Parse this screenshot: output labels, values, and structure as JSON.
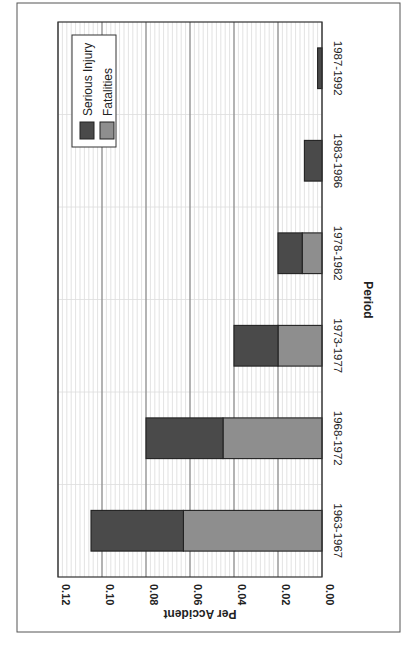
{
  "chart_data": {
    "type": "bar",
    "stacked": true,
    "orientation": "rotated 90 degrees clockwise (vertical bars drawn as horizontal on page)",
    "title": "",
    "xlabel": "Period",
    "ylabel": "Per Accident",
    "ylim": [
      0,
      0.12
    ],
    "yticks": [
      "0.00",
      "0.02",
      "0.04",
      "0.06",
      "0.08",
      "0.10",
      "0.12"
    ],
    "categories": [
      "1963-1967",
      "1968-1972",
      "1973-1977",
      "1978-1982",
      "1983-1986",
      "1987-1992"
    ],
    "series": [
      {
        "name": "Fatalities",
        "color": "#8e8e8e",
        "values": [
          0.063,
          0.045,
          0.02,
          0.009,
          0.0,
          0.0
        ]
      },
      {
        "name": "Serious Injury",
        "color": "#4a4a4a",
        "values": [
          0.042,
          0.035,
          0.02,
          0.011,
          0.008,
          0.002
        ]
      }
    ],
    "totals": [
      0.105,
      0.08,
      0.04,
      0.02,
      0.008,
      0.002
    ],
    "legend": {
      "position": "upper-right (rotated)",
      "entries": [
        "Serious Injury",
        "Fatalities"
      ]
    },
    "grid": {
      "major": true,
      "minor": true
    }
  },
  "colors": {
    "frame": "#555555",
    "axis": "#333333",
    "major_grid": "#777777",
    "minor_grid": "#cfcfcf",
    "category_grid": "#dddddd"
  }
}
